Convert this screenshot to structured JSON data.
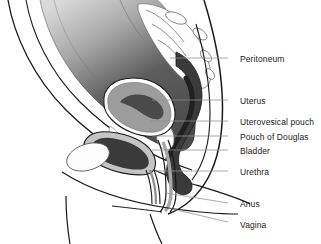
{
  "figure": {
    "width": 321,
    "height": 244,
    "background_color": "#ffffff"
  },
  "palette": {
    "outline": "#1a1a1a",
    "leader_line": "#8f8f8f",
    "label_text": "#1b1b1b",
    "peritoneal_cavity_dark": "#4a4a4a",
    "peritoneal_cavity_light": "#d8d8d8",
    "body_wall_white": "#ffffff",
    "organ_mid_gray": "#9d9d9d",
    "organ_light_gray": "#c4c4c4",
    "lumen_dark": "#3a3a3a",
    "bone_white": "#fdfdfd"
  },
  "labels": [
    {
      "id": "peritoneum",
      "text": "Peritoneum",
      "x": 240,
      "y": 55,
      "leader": {
        "x1": 228,
        "y1": 58,
        "x2": 170,
        "y2": 58
      }
    },
    {
      "id": "uterus",
      "text": "Uterus",
      "x": 240,
      "y": 97,
      "leader": {
        "x1": 228,
        "y1": 100,
        "x2": 152,
        "y2": 100
      }
    },
    {
      "id": "uterovesical-pouch",
      "text": "Uterovesical pouch",
      "x": 240,
      "y": 118,
      "leader": {
        "x1": 228,
        "y1": 121,
        "x2": 150,
        "y2": 121
      }
    },
    {
      "id": "pouch-of-douglas",
      "text": "Pouch of Douglas",
      "x": 240,
      "y": 133,
      "leader": {
        "x1": 228,
        "y1": 136,
        "x2": 152,
        "y2": 136
      }
    },
    {
      "id": "bladder",
      "text": "Bladder",
      "x": 240,
      "y": 147,
      "leader": {
        "x1": 228,
        "y1": 150,
        "x2": 152,
        "y2": 150
      }
    },
    {
      "id": "urethra",
      "text": "Urethra",
      "x": 240,
      "y": 168,
      "leader": {
        "x1": 228,
        "y1": 171,
        "x2": 155,
        "y2": 171
      }
    },
    {
      "id": "anus",
      "text": "Anus",
      "x": 240,
      "y": 200,
      "leader": {
        "x1": 228,
        "y1": 203,
        "x2": 166,
        "y2": 193
      }
    },
    {
      "id": "vagina",
      "text": "Vagina",
      "x": 240,
      "y": 221,
      "leader": {
        "x1": 228,
        "y1": 222,
        "x2": 168,
        "y2": 208
      }
    }
  ]
}
